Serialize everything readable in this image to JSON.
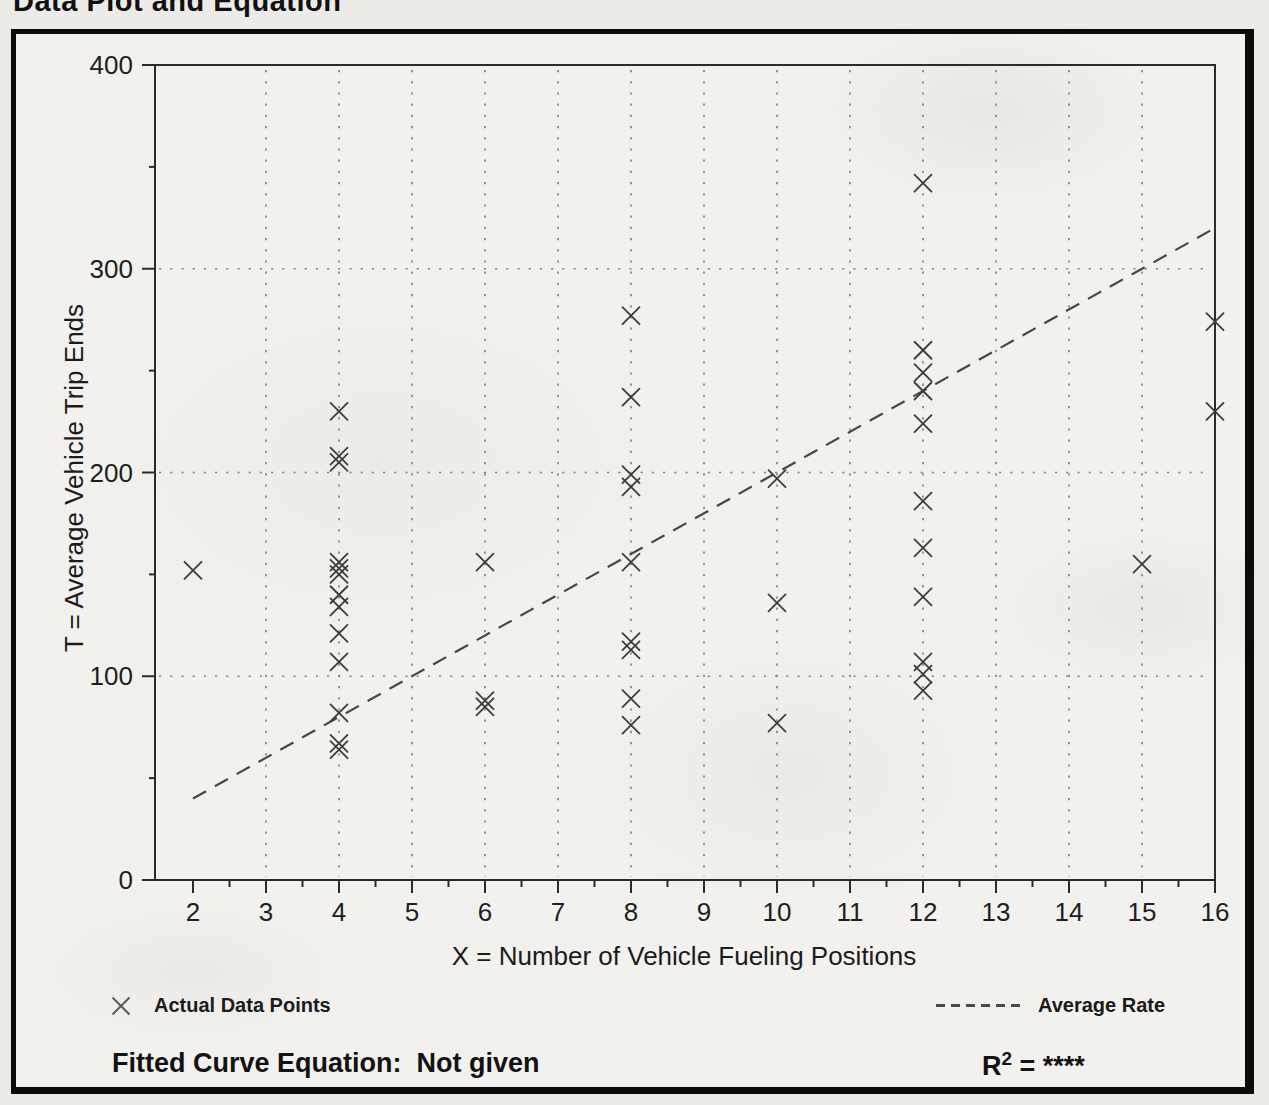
{
  "page": {
    "title": "Data Plot and Equation"
  },
  "colors": {
    "paper": "#f2f1ed",
    "page_background": "#ecebe7",
    "border_ink": "#0b0b0b",
    "axis_ink": "#2b2b2b",
    "grid_dot": "#6a6a6a",
    "marker_ink": "#3c3c3c",
    "trend_ink": "#474747",
    "text_ink": "#1b1b1b"
  },
  "chart_data": {
    "type": "scatter",
    "title": "Data Plot and Equation",
    "xlabel": "X = Number of Vehicle Fueling Positions",
    "ylabel": "T = Average Vehicle Trip Ends",
    "xlim": [
      2,
      16
    ],
    "ylim": [
      0,
      400
    ],
    "grid": {
      "style": "dotted",
      "x_values": [
        3,
        4,
        5,
        6,
        7,
        8,
        9,
        10,
        11,
        12,
        13,
        14,
        15
      ],
      "y_values": [
        100,
        200,
        300
      ]
    },
    "x_axis": {
      "major_ticks": [
        2,
        3,
        4,
        5,
        6,
        7,
        8,
        9,
        10,
        11,
        12,
        13,
        14,
        15,
        16
      ],
      "minor_ticks": [
        2.5,
        3.5,
        4.5,
        5.5,
        6.5,
        7.5,
        8.5,
        9.5,
        10.5,
        11.5,
        12.5,
        13.5,
        14.5,
        15.5
      ]
    },
    "y_axis": {
      "major_ticks": [
        0,
        100,
        200,
        300,
        400
      ],
      "minor_ticks": [
        50,
        150,
        250,
        350
      ]
    },
    "series": [
      {
        "name": "Actual Data Points",
        "marker": "x",
        "points": [
          [
            2,
            152
          ],
          [
            4,
            230
          ],
          [
            4,
            208
          ],
          [
            4,
            205
          ],
          [
            4,
            156
          ],
          [
            4,
            153
          ],
          [
            4,
            150
          ],
          [
            4,
            140
          ],
          [
            4,
            134
          ],
          [
            4,
            121
          ],
          [
            4,
            107
          ],
          [
            4,
            82
          ],
          [
            4,
            67
          ],
          [
            4,
            64
          ],
          [
            6,
            156
          ],
          [
            6,
            88
          ],
          [
            6,
            85
          ],
          [
            8,
            277
          ],
          [
            8,
            237
          ],
          [
            8,
            199
          ],
          [
            8,
            193
          ],
          [
            8,
            156
          ],
          [
            8,
            117
          ],
          [
            8,
            113
          ],
          [
            8,
            89
          ],
          [
            8,
            76
          ],
          [
            10,
            197
          ],
          [
            10,
            136
          ],
          [
            10,
            77
          ],
          [
            12,
            342
          ],
          [
            12,
            260
          ],
          [
            12,
            249
          ],
          [
            12,
            240
          ],
          [
            12,
            224
          ],
          [
            12,
            186
          ],
          [
            12,
            163
          ],
          [
            12,
            139
          ],
          [
            12,
            107
          ],
          [
            12,
            101
          ],
          [
            12,
            93
          ],
          [
            15,
            155
          ],
          [
            16,
            274
          ],
          [
            16,
            230
          ]
        ]
      }
    ],
    "trend_line": {
      "name": "Average Rate",
      "style": "dashed",
      "from": [
        2,
        40
      ],
      "to": [
        16,
        320
      ],
      "rate_per_position": 20
    }
  },
  "legend": {
    "points_label": "Actual Data Points",
    "line_label": "Average Rate"
  },
  "footer": {
    "equation_label": "Fitted Curve Equation:",
    "equation_value": "Not given",
    "r2_base": "R",
    "r2_exp": "2",
    "r2_rest": " = ****"
  }
}
